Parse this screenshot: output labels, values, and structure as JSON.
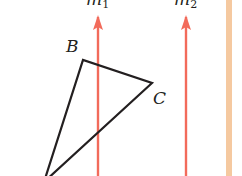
{
  "diagram": {
    "lines": [
      {
        "name": "m",
        "subscript": "1",
        "x": 98,
        "color": "#f26b5b"
      },
      {
        "name": "m",
        "subscript": "2",
        "x": 186,
        "color": "#f26b5b"
      }
    ],
    "triangle": {
      "vertices": {
        "A": {
          "x": 44,
          "y": 182,
          "label_visible": false
        },
        "B": {
          "x": 83,
          "y": 60,
          "label": "B"
        },
        "C": {
          "x": 152,
          "y": 83,
          "label": "C"
        }
      },
      "stroke": "#231f20"
    },
    "labels": {
      "m1": "m",
      "m1_sub": "1",
      "m2": "m",
      "m2_sub": "2",
      "B": "B",
      "C": "C"
    },
    "border_stripe_color": "#f5c9a0"
  }
}
